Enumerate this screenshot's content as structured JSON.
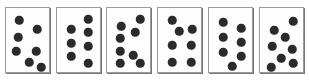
{
  "figure": {
    "type": "dot-pattern-card-array",
    "width": 309,
    "height": 82,
    "background_color": "#ffffff",
    "card_count": 6
  },
  "style": {
    "card_fill": "#fdfdfd",
    "card_border_color": "#9a9a9a",
    "card_shadow_color": "#787878",
    "dot_color": "#2b2b2b",
    "dot_diameter": 8.5
  },
  "cards": [
    {
      "index": 1,
      "name": "card-1",
      "dot_count": 7,
      "layout": "scattered-zigzag",
      "x": 5,
      "y": 7,
      "width": 45,
      "height": 66,
      "dots": [
        {
          "cx": 13,
          "cy": 12
        },
        {
          "cx": 31,
          "cy": 21
        },
        {
          "cx": 12,
          "cy": 29
        },
        {
          "cx": 10,
          "cy": 43
        },
        {
          "cx": 30,
          "cy": 43
        },
        {
          "cx": 23,
          "cy": 54
        },
        {
          "cx": 35,
          "cy": 59
        }
      ]
    },
    {
      "index": 2,
      "name": "card-2",
      "dot_count": 7,
      "layout": "two-columns-3-and-4",
      "x": 56,
      "y": 7,
      "width": 45,
      "height": 66,
      "dots": [
        {
          "cx": 31,
          "cy": 11
        },
        {
          "cx": 14,
          "cy": 21
        },
        {
          "cx": 31,
          "cy": 24
        },
        {
          "cx": 14,
          "cy": 35
        },
        {
          "cx": 31,
          "cy": 38
        },
        {
          "cx": 14,
          "cy": 48
        },
        {
          "cx": 31,
          "cy": 55
        }
      ]
    },
    {
      "index": 3,
      "name": "card-3",
      "dot_count": 8,
      "layout": "column-plus-diagonal",
      "x": 106,
      "y": 7,
      "width": 45,
      "height": 66,
      "dots": [
        {
          "cx": 33,
          "cy": 11
        },
        {
          "cx": 14,
          "cy": 18
        },
        {
          "cx": 28,
          "cy": 24
        },
        {
          "cx": 13,
          "cy": 30
        },
        {
          "cx": 13,
          "cy": 43
        },
        {
          "cx": 26,
          "cy": 47
        },
        {
          "cx": 13,
          "cy": 55
        },
        {
          "cx": 33,
          "cy": 55
        }
      ]
    },
    {
      "index": 4,
      "name": "card-4",
      "dot_count": 7,
      "layout": "stagger-plus-two-by-two",
      "x": 157,
      "y": 7,
      "width": 45,
      "height": 66,
      "dots": [
        {
          "cx": 14,
          "cy": 12
        },
        {
          "cx": 21,
          "cy": 23
        },
        {
          "cx": 34,
          "cy": 21
        },
        {
          "cx": 14,
          "cy": 37
        },
        {
          "cx": 33,
          "cy": 37
        },
        {
          "cx": 14,
          "cy": 54
        },
        {
          "cx": 33,
          "cy": 54
        }
      ]
    },
    {
      "index": 5,
      "name": "card-5",
      "dot_count": 7,
      "layout": "two-columns-of-3-plus-one",
      "x": 208,
      "y": 7,
      "width": 45,
      "height": 66,
      "dots": [
        {
          "cx": 14,
          "cy": 14
        },
        {
          "cx": 32,
          "cy": 20
        },
        {
          "cx": 14,
          "cy": 29
        },
        {
          "cx": 32,
          "cy": 34
        },
        {
          "cx": 14,
          "cy": 44
        },
        {
          "cx": 32,
          "cy": 48
        },
        {
          "cx": 23,
          "cy": 58
        }
      ]
    },
    {
      "index": 6,
      "name": "card-6",
      "dot_count": 8,
      "layout": "scattered-zigzag",
      "x": 259,
      "y": 7,
      "width": 45,
      "height": 66,
      "dots": [
        {
          "cx": 33,
          "cy": 13
        },
        {
          "cx": 14,
          "cy": 22
        },
        {
          "cx": 25,
          "cy": 29
        },
        {
          "cx": 12,
          "cy": 38
        },
        {
          "cx": 32,
          "cy": 41
        },
        {
          "cx": 21,
          "cy": 50
        },
        {
          "cx": 11,
          "cy": 59
        },
        {
          "cx": 33,
          "cy": 55
        }
      ]
    }
  ]
}
